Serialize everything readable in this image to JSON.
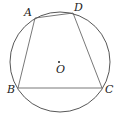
{
  "diagram": {
    "type": "geometry",
    "circle": {
      "center_label": "O",
      "cx": 60,
      "cy": 62,
      "r": 50
    },
    "points": [
      {
        "name": "A",
        "x": 35,
        "y": 18,
        "label_x": 24,
        "label_y": 16
      },
      {
        "name": "D",
        "x": 73,
        "y": 13,
        "label_x": 74,
        "label_y": 11
      },
      {
        "name": "C",
        "x": 102,
        "y": 88,
        "label_x": 105,
        "label_y": 93
      },
      {
        "name": "B",
        "x": 18,
        "y": 88,
        "label_x": 7,
        "label_y": 93
      }
    ],
    "segments": [
      [
        "A",
        "D"
      ],
      [
        "D",
        "C"
      ],
      [
        "C",
        "B"
      ],
      [
        "B",
        "A"
      ]
    ],
    "center": {
      "name": "O",
      "x": 59,
      "y": 62,
      "label_x": 56,
      "label_y": 73
    },
    "colors": {
      "stroke": "#555555",
      "circle": "#444444",
      "text": "#222222"
    }
  }
}
